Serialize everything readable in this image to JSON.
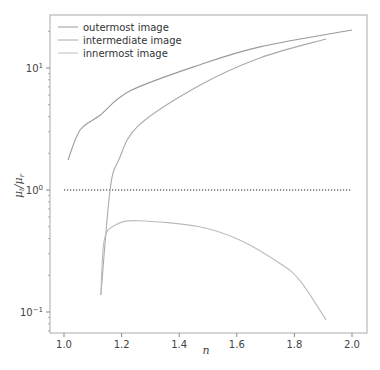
{
  "chart_data": {
    "type": "line",
    "title": "",
    "xlabel": "n",
    "ylabel": "μt/μr",
    "yscale": "log",
    "xlim": [
      0.95,
      2.05
    ],
    "ylim": [
      0.067,
      27
    ],
    "grid": false,
    "legend_position": "upper left",
    "x_ticks": [
      1.0,
      1.2,
      1.4,
      1.6,
      1.8,
      2.0
    ],
    "x_tick_labels": [
      "1.0",
      "1.2",
      "1.4",
      "1.6",
      "1.8",
      "2.0"
    ],
    "y_ticks": [
      0.1,
      1,
      10
    ],
    "y_tick_labels": [
      "10⁻¹",
      "10⁰",
      "10¹"
    ],
    "reference_line": {
      "y": 1.0,
      "x_start": 1.0,
      "x_end": 2.0,
      "style": "dotted",
      "color": "#222222"
    },
    "series": [
      {
        "name": "outermost image",
        "color": "#999999",
        "x": [
          1.014,
          1.056,
          1.125,
          1.23,
          1.47,
          1.68,
          2.0
        ],
        "y": [
          1.76,
          3.1,
          4.1,
          6.5,
          10.6,
          14.9,
          20.5
        ]
      },
      {
        "name": "intermediate image",
        "color": "#aaaaaa",
        "x": [
          1.128,
          1.16,
          1.19,
          1.26,
          1.47,
          1.68,
          1.91
        ],
        "y": [
          0.138,
          1.0,
          1.76,
          3.4,
          7.2,
          12.1,
          17.3
        ]
      },
      {
        "name": "innermost image",
        "color": "#bbbbbb",
        "x": [
          1.128,
          1.14,
          1.18,
          1.26,
          1.47,
          1.61,
          1.75,
          1.82,
          1.91
        ],
        "y": [
          0.138,
          0.39,
          0.52,
          0.56,
          0.5,
          0.39,
          0.25,
          0.18,
          0.086
        ]
      }
    ]
  },
  "legend": {
    "items": [
      {
        "label": "outermost image"
      },
      {
        "label": "intermediate image"
      },
      {
        "label": "innermost image"
      }
    ]
  },
  "axes": {
    "xlabel": "n",
    "ylabel_main": "μ",
    "ylabel_sub1": "t",
    "ylabel_sub2": "r",
    "xticks": [
      "1.0",
      "1.2",
      "1.4",
      "1.6",
      "1.8",
      "2.0"
    ],
    "yticks": [
      {
        "base": "10",
        "exp": "1"
      },
      {
        "base": "10",
        "exp": "0"
      },
      {
        "base": "10",
        "exp": "−1"
      }
    ]
  }
}
